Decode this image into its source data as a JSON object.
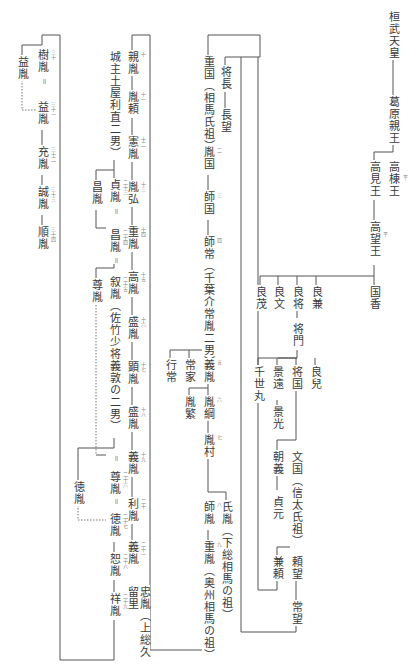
{
  "nodes": {
    "kanmu": "桓武天皇",
    "kazurahara": "葛原親王",
    "takamune": "高棟王",
    "takami": "高見王",
    "takamochi": "高望王",
    "kunika": "国香",
    "yoshikane": "良兼",
    "yoshimasa": "良将",
    "yoshifumi": "良文",
    "yoshimochi": "良茂",
    "masakado": "将門",
    "yoshikado": "良兒",
    "masakuni": "将国",
    "kagetō": "景遠",
    "chiyomaru": "千世丸",
    "kagemitsu": "景光",
    "fumikuni": "文国（信太氏祖）",
    "tomoyoshi": "朝義",
    "sadamoto": "貞元",
    "yorimochi": "頼望",
    "kaneyori": "兼頼",
    "tsunemochi": "常望",
    "shigekuni": "重国（相馬氏祖）",
    "masanaga": "将長",
    "nagamochi": "長望",
    "tanekuni": "胤国",
    "morokuni": "師国",
    "morotsune": "師常（千葉介常胤二男）",
    "yoshitane": "義胤",
    "tsuneie": "常家",
    "yukitsune": "行常",
    "tanetsuna": "胤綱",
    "taneshige": "胤繁",
    "tanemura": "胤村",
    "morotane": "師胤",
    "ujitane": "氏胤（下総相馬の祖）",
    "shigetane": "重胤（奥州相馬の祖）",
    "chikatane": "親胤",
    "taneyori": "胤頼",
    "kentane": "憲胤",
    "tanehiro": "胤弘",
    "shigetane2": "重胤",
    "takatane": "高胤",
    "moritane": "盛胤",
    "akitane": "顕胤",
    "moritane2": "盛胤",
    "yoshitane2": "義胤",
    "toshitane": "利胤",
    "yoshitane3": "義胤",
    "tadatane": "忠胤（上総久留里",
    "sadatane": "貞胤",
    "masatane_l": "昌胤",
    "masatane": "昌胤",
    "nobutane": "叙胤（佐竹少将義敦の二男）",
    "tokitane_l": "尊胤",
    "tokitane": "尊胤",
    "noritane_l": "徳胤",
    "noritane": "徳胤",
    "nobutane2": "恕胤",
    "yoshitane4": "祥胤",
    "tsuchiya": "城主土屋利直二男）",
    "kitane": "樹胤",
    "masutane_l": "益胤",
    "masutane": "益胤",
    "mitsutane": "充胤",
    "masatane2": "誠胤",
    "tomotane": "順胤"
  },
  "generations": {
    "takamune": "平",
    "takamochi": "平",
    "tanekuni": "二",
    "morokuni": "三",
    "morotsune": "四",
    "yoshitane": "五",
    "tanetsuna": "六",
    "tanemura": "七",
    "morotane": "八",
    "shigetane": "九",
    "chikatane": "十",
    "taneyori": "十一",
    "kentane": "十二",
    "tanehiro": "十三",
    "shigetane2": "十四",
    "takatane": "十五",
    "moritane": "十六",
    "akitane": "十七",
    "moritane2": "十八",
    "yoshitane2": "十九",
    "toshitane": "二十",
    "yoshitane3": "二十一",
    "tadatane": "二十二",
    "sadatane": "二十三",
    "masatane": "二十四",
    "nobutane": "二十五",
    "tokitane": "二十六",
    "noritane": "二十七",
    "nobutane2": "二十八",
    "yoshitane4": "二十九",
    "kitane": "三十",
    "masutane": "三十一",
    "mitsutane": "三十二",
    "masatane2": "三十三",
    "tomotane": "三十四"
  },
  "adoption_mark": "＝"
}
